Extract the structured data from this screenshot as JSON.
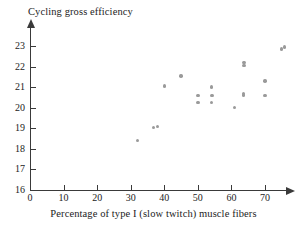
{
  "chart_data": {
    "type": "scatter",
    "title": "Cycling gross efficiency",
    "xlabel": "Percentage of type I (slow twitch) muscle fibers",
    "ylabel": "Cycling gross efficiency",
    "xlim": [
      0,
      76
    ],
    "ylim": [
      16,
      23.4
    ],
    "xticks": [
      0,
      10,
      20,
      30,
      40,
      50,
      60,
      70
    ],
    "yticks": [
      16,
      17,
      18,
      19,
      20,
      21,
      22,
      23
    ],
    "xtick_labels": [
      "0",
      "10",
      "20",
      "30",
      "40",
      "50",
      "60",
      "70"
    ],
    "ytick_labels": [
      "16",
      "17",
      "18",
      "19",
      "20",
      "21",
      "22",
      "23"
    ],
    "grid": false,
    "legend": null,
    "marker_color": "#9a9a9a",
    "axis_color": "#3a3a3a",
    "points": [
      {
        "x": 32.0,
        "y": 18.4
      },
      {
        "x": 36.8,
        "y": 19.05
      },
      {
        "x": 38.0,
        "y": 19.1
      },
      {
        "x": 40.0,
        "y": 21.05
      },
      {
        "x": 45.0,
        "y": 21.55
      },
      {
        "x": 50.0,
        "y": 20.6
      },
      {
        "x": 50.0,
        "y": 20.25
      },
      {
        "x": 54.0,
        "y": 21.0
      },
      {
        "x": 54.2,
        "y": 20.6
      },
      {
        "x": 54.0,
        "y": 20.25
      },
      {
        "x": 61.0,
        "y": 20.0
      },
      {
        "x": 63.8,
        "y": 22.2
      },
      {
        "x": 63.8,
        "y": 22.05
      },
      {
        "x": 63.6,
        "y": 20.7
      },
      {
        "x": 63.6,
        "y": 20.62
      },
      {
        "x": 70.0,
        "y": 21.3
      },
      {
        "x": 70.0,
        "y": 20.6
      },
      {
        "x": 75.0,
        "y": 22.85
      },
      {
        "x": 75.9,
        "y": 22.95
      }
    ]
  }
}
